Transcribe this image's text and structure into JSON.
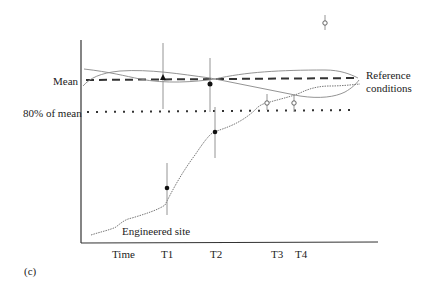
{
  "figure": {
    "panel_label": "(c)",
    "y_labels": {
      "mean": "Mean",
      "eighty_percent": "80% of mean"
    },
    "series_labels": {
      "reference_line1": "Reference",
      "reference_line2": "conditions",
      "engineered": "Engineered site"
    },
    "x_axis": {
      "title": "Time",
      "ticks": [
        "T1",
        "T2",
        "T3",
        "T4"
      ]
    },
    "colors": {
      "axis": "#333333",
      "mean_line": "#333333",
      "curves": "#888888",
      "points": "#111111"
    }
  }
}
